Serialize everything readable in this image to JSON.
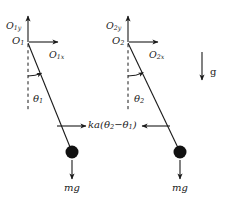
{
  "figure": {
    "background_color": "#ffffff",
    "stroke_color": "#1a1a1a",
    "bob_color": "#111111"
  },
  "labels": {
    "axis_y1": "O",
    "axis_y1_sub": "1y",
    "axis_x1": "O",
    "axis_x1_sub": "1x",
    "origin_1": "O",
    "origin_1_sub": "1",
    "axis_y2": "O",
    "axis_y2_sub": "2y",
    "axis_x2": "O",
    "axis_x2_sub": "2x",
    "origin_2": "O",
    "origin_2_sub": "2",
    "theta_1": "θ",
    "theta_1_sub": "1",
    "theta_2": "θ",
    "theta_2_sub": "2",
    "coupling_force_prefix": "ka(θ",
    "coupling_force_sub1": "2",
    "coupling_force_mid": "−θ",
    "coupling_force_sub2": "1",
    "coupling_force_suffix": ")",
    "gravity": "g",
    "weight_left": "mg",
    "weight_right": "mg"
  },
  "geometry": {
    "pendulum_1": {
      "pivot_x": 28,
      "pivot_y": 42,
      "bob_x": 72,
      "bob_y": 152,
      "bob_radius": 6.5,
      "vertical_dash_end_y": 112,
      "y_axis_tip_y": 14,
      "x_axis_tip_x": 62,
      "angle_arc_radius": 34,
      "angle_degrees": 22
    },
    "pendulum_2": {
      "pivot_x": 128,
      "pivot_y": 42,
      "bob_x": 180,
      "bob_y": 152,
      "bob_radius": 6.5,
      "vertical_dash_end_y": 112,
      "y_axis_tip_y": 14,
      "x_axis_tip_x": 162,
      "angle_arc_radius": 34,
      "angle_degrees": 25
    },
    "coupling_arrows": {
      "y": 126,
      "left_start_x": 57,
      "left_end_x": 88,
      "right_start_x": 170,
      "right_end_x": 140
    },
    "gravity_arrow": {
      "x": 205,
      "start_y": 52,
      "end_y": 82
    },
    "weight_arrows": {
      "left_x": 72,
      "right_x": 180,
      "start_y": 161,
      "end_y": 181
    }
  }
}
